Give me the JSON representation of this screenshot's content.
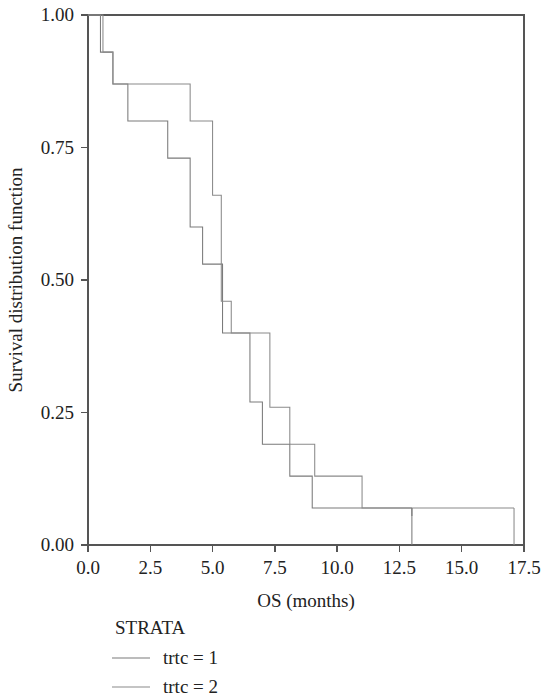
{
  "figure": {
    "background": "#ffffff",
    "width": 541,
    "height": 698
  },
  "chart_data": {
    "type": "line",
    "subtype": "kaplan-meier-step",
    "title": "",
    "xlabel": "OS (months)",
    "ylabel": "Survival distribution function",
    "xlim": [
      0.0,
      17.5
    ],
    "ylim": [
      0.0,
      1.0
    ],
    "xticks": [
      0.0,
      2.5,
      5.0,
      7.5,
      10.0,
      12.5,
      15.0,
      17.5
    ],
    "xtick_labels": [
      "0.0",
      "2.5",
      "5.0",
      "7.5",
      "10.0",
      "12.5",
      "15.0",
      "17.5"
    ],
    "yticks": [
      0.0,
      0.25,
      0.5,
      0.75,
      1.0
    ],
    "ytick_labels": [
      "0.00",
      "0.25",
      "0.50",
      "0.75",
      "1.00"
    ],
    "grid": false,
    "legend_title": "STRATA",
    "legend_position": "below-left",
    "series": [
      {
        "name": "trtc = 1",
        "color": "#7a7a7a",
        "x": [
          0.0,
          0.5,
          0.5,
          1.0,
          1.0,
          1.6,
          1.6,
          3.2,
          3.2,
          4.1,
          4.1,
          4.6,
          4.6,
          5.2,
          5.2,
          5.4,
          5.4,
          5.9,
          5.9,
          6.5,
          6.5,
          7.0,
          7.0,
          8.1,
          8.1,
          9.0,
          9.0,
          13.0
        ],
        "y": [
          1.0,
          1.0,
          0.93,
          0.93,
          0.87,
          0.87,
          0.8,
          0.8,
          0.73,
          0.73,
          0.6,
          0.6,
          0.53,
          0.53,
          0.53,
          0.53,
          0.4,
          0.4,
          0.4,
          0.4,
          0.27,
          0.27,
          0.19,
          0.19,
          0.13,
          0.13,
          0.07,
          0.07
        ],
        "censor_x": [
          13.0
        ],
        "censor_y": [
          0.07
        ]
      },
      {
        "name": "trtc = 2",
        "color": "#8a8a8a",
        "x": [
          0.0,
          0.6,
          0.6,
          1.0,
          1.0,
          4.1,
          4.1,
          5.0,
          5.0,
          5.35,
          5.35,
          5.75,
          5.75,
          6.6,
          6.6,
          7.3,
          7.3,
          8.1,
          8.1,
          9.1,
          9.1,
          11.0,
          11.0,
          17.1
        ],
        "y": [
          1.0,
          1.0,
          0.93,
          0.93,
          0.87,
          0.87,
          0.8,
          0.8,
          0.66,
          0.66,
          0.46,
          0.46,
          0.4,
          0.4,
          0.4,
          0.4,
          0.26,
          0.26,
          0.19,
          0.19,
          0.13,
          0.13,
          0.07,
          0.07
        ],
        "censor_x": [],
        "censor_y": []
      }
    ],
    "terminal_drops": [
      {
        "series": "trtc = 1",
        "x": 13.0,
        "from_y": 0.07,
        "to_y": 0.0
      },
      {
        "series": "trtc = 2",
        "x": 17.1,
        "from_y": 0.07,
        "to_y": 0.0
      }
    ]
  },
  "legend": {
    "title": "STRATA",
    "entries": [
      {
        "label": "trtc = 1",
        "color": "#7a7a7a"
      },
      {
        "label": "trtc = 2",
        "color": "#8a8a8a"
      }
    ]
  },
  "axes": {
    "frame_color": "#555555",
    "x_title": "OS (months)",
    "y_title": "Survival distribution function"
  }
}
